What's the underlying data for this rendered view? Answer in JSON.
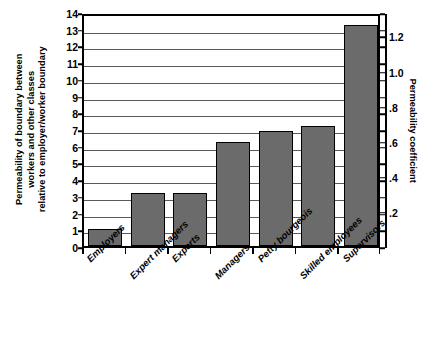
{
  "chart_data": {
    "type": "bar",
    "title": "",
    "subtitle": "",
    "categories": [
      "Employers",
      "Expert managers",
      "Experts",
      "Managers",
      "Petty bourgeois",
      "Skilled employees",
      "Supervisors"
    ],
    "values": [
      1.0,
      3.15,
      3.2,
      6.25,
      6.9,
      7.2,
      13.25
    ],
    "series": [
      {
        "name": "Permeability of boundary",
        "values": [
          1.0,
          3.15,
          3.2,
          6.25,
          6.9,
          7.2,
          13.25
        ]
      }
    ],
    "xlabel": "",
    "ylabel": "Permeability of boundary between workers and other classes relative to employer/worker boundary",
    "ylabel_lines": [
      "Permeability of boundary between",
      "workers and other classes",
      "relative to employer/worker boundary"
    ],
    "ylim": [
      0,
      14
    ],
    "yticks": [
      0,
      1,
      2,
      3,
      4,
      5,
      6,
      7,
      8,
      9,
      10,
      11,
      12,
      13,
      14
    ],
    "ytick_labels": [
      "0",
      "1",
      "2",
      "3",
      "4",
      "5",
      "6",
      "7",
      "8",
      "9",
      "10",
      "11",
      "12",
      "13",
      "14"
    ],
    "secondary_axis": {
      "label": "Permeability coefficient",
      "ticks": [
        0.2,
        0.4,
        0.6,
        0.8,
        1.0,
        1.2
      ],
      "tick_labels": [
        ".2",
        ".4",
        ".6",
        ".8",
        "1.0",
        "1.2"
      ],
      "scale_factor": 10.5,
      "position": "right"
    },
    "grid": {
      "horizontal": true,
      "vertical": false
    },
    "legend": {
      "visible": false,
      "position": "none"
    },
    "colors": {
      "bar_fill": "#6b6b6b",
      "bar_edge": "#000000",
      "gridline": "#5a5a5a",
      "frame": "#000000",
      "background": "#ffffff",
      "text": "#000000"
    }
  }
}
